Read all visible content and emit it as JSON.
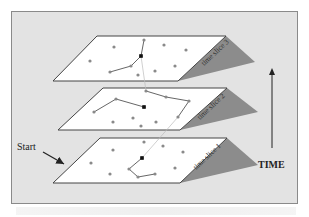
{
  "diagram": {
    "start_label": "Start",
    "time_label": "TIME",
    "caption_text": "",
    "slices": [
      {
        "label": "time slice 1",
        "plane": "100,138 227,138 180,183 53,183",
        "shadow": "180,183 227,138 258,165",
        "label_x": 196,
        "label_y": 170,
        "label_rot": -43,
        "points": [
          [
            144,
            142
          ],
          [
            113,
            150
          ],
          [
            163,
            146
          ],
          [
            183,
            152
          ],
          [
            91,
            163
          ],
          [
            142,
            158
          ],
          [
            129,
            169
          ],
          [
            138,
            177
          ],
          [
            155,
            174
          ],
          [
            175,
            168
          ],
          [
            110,
            174
          ]
        ],
        "black": [
          [
            142,
            158
          ]
        ],
        "path": "142,158 129,169 138,177 155,174"
      },
      {
        "label": "time slice 2",
        "plane": "103,88 227,88 180,130 58,130",
        "shadow": "180,130 227,88 258,112",
        "label_x": 200,
        "label_y": 120,
        "label_rot": -43,
        "points": [
          [
            146,
            91
          ],
          [
            116,
            99
          ],
          [
            166,
            97
          ],
          [
            189,
            101
          ],
          [
            144,
            107
          ],
          [
            94,
            112
          ],
          [
            178,
            117
          ],
          [
            113,
            122
          ],
          [
            133,
            118
          ],
          [
            141,
            126
          ],
          [
            156,
            122
          ]
        ],
        "black": [
          [
            144,
            107
          ]
        ],
        "path_segments": [
          "94,112 116,99 144,107",
          "146,91 166,97 189,101 178,117"
        ]
      },
      {
        "label": "time slice 3",
        "plane": "97,36 226,36 178,81 53,81",
        "shadow": "178,81 226,36 255,62",
        "label_x": 204,
        "label_y": 66,
        "label_rot": -43,
        "points": [
          [
            144,
            40
          ],
          [
            114,
            47
          ],
          [
            164,
            45
          ],
          [
            186,
            50
          ],
          [
            141,
            56
          ],
          [
            90,
            61
          ],
          [
            131,
            66
          ],
          [
            110,
            72
          ],
          [
            138,
            75
          ],
          [
            155,
            71
          ],
          [
            175,
            66
          ]
        ],
        "black": [
          [
            141,
            56
          ]
        ],
        "path": "144,40 141,56 131,66 110,72"
      }
    ],
    "inter_slice_links": [
      "142,158 178,117",
      "146,91 141,56"
    ],
    "colors": {
      "frame_bg": "#e3e3e3",
      "plane_fill": "#ffffff",
      "plane_stroke": "#444444",
      "shadow": "#8c8c8c",
      "point": "#8a8a8a",
      "black_point": "#111111",
      "path": "#555555"
    }
  }
}
